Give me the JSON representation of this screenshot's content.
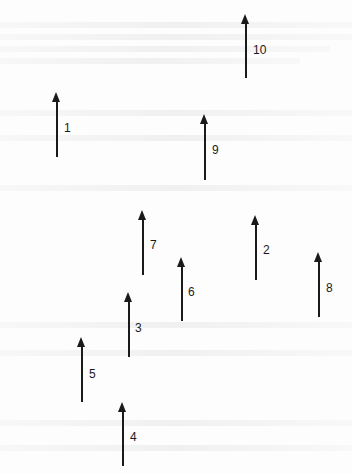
{
  "diagram": {
    "type": "vector-field",
    "arrow_color": "#1a1a1a",
    "background": "#fdfdfd",
    "arrows": [
      {
        "id": "1",
        "label": "1",
        "x": 56,
        "y_tip": 92,
        "y_tail": 157,
        "label_x": 64,
        "label_y": 122
      },
      {
        "id": "2",
        "label": "2",
        "x": 255,
        "y_tip": 215,
        "y_tail": 280,
        "label_x": 263,
        "label_y": 244
      },
      {
        "id": "3",
        "label": "3",
        "x": 128,
        "y_tip": 292,
        "y_tail": 357,
        "label_x": 135,
        "label_y": 322
      },
      {
        "id": "4",
        "label": "4",
        "x": 122,
        "y_tip": 402,
        "y_tail": 466,
        "label_x": 130,
        "label_y": 431
      },
      {
        "id": "5",
        "label": "5",
        "x": 81,
        "y_tip": 337,
        "y_tail": 402,
        "label_x": 89,
        "label_y": 368
      },
      {
        "id": "6",
        "label": "6",
        "x": 181,
        "y_tip": 257,
        "y_tail": 321,
        "label_x": 188,
        "label_y": 286
      },
      {
        "id": "7",
        "label": "7",
        "x": 142,
        "y_tip": 210,
        "y_tail": 275,
        "label_x": 150,
        "label_y": 239
      },
      {
        "id": "8",
        "label": "8",
        "x": 318,
        "y_tip": 252,
        "y_tail": 317,
        "label_x": 326,
        "label_y": 282
      },
      {
        "id": "9",
        "label": "9",
        "x": 204,
        "y_tip": 114,
        "y_tail": 180,
        "label_x": 212,
        "label_y": 144
      },
      {
        "id": "10",
        "label": "10",
        "x": 245,
        "y_tip": 14,
        "y_tail": 78,
        "label_x": 253,
        "label_y": 44
      }
    ]
  }
}
